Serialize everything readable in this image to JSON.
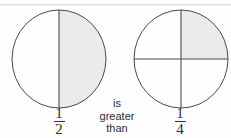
{
  "figure": {
    "type": "fraction-comparison-diagram",
    "statement": "1/2 is greater than 1/4",
    "colors": {
      "background": "#fefefe",
      "outline": "#4a4a4a",
      "shading": "#ebebeb",
      "text": "#2b2b2b"
    },
    "comparison": {
      "line1": "is",
      "line2": "greater",
      "line3": "than"
    },
    "left": {
      "name": "one-half-circle",
      "label_numerator": "1",
      "label_denominator": "2",
      "parts_total": 2,
      "parts_shaded": 1,
      "value": 0.5,
      "divider_orientation": "vertical",
      "shaded_region": "right-half"
    },
    "right": {
      "name": "one-quarter-circle",
      "label_numerator": "1",
      "label_denominator": "4",
      "parts_total": 4,
      "parts_shaded": 1,
      "value": 0.25,
      "divider_orientation": "vertical-and-horizontal",
      "shaded_region": "upper-right-quadrant"
    }
  }
}
